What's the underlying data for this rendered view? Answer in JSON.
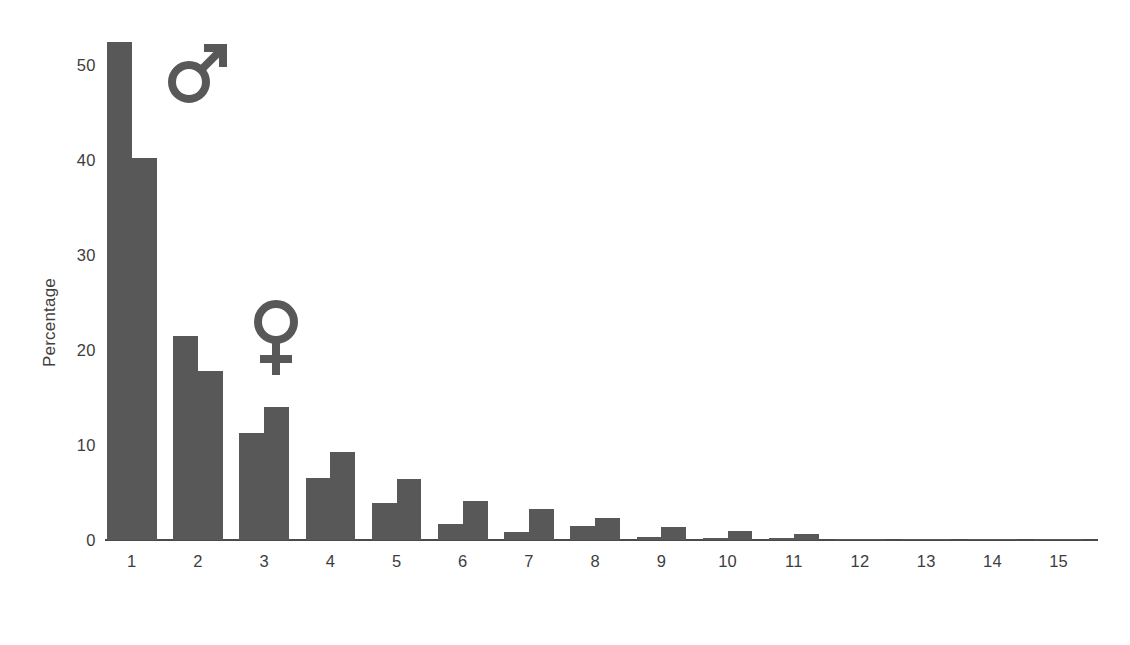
{
  "chart_data": {
    "type": "bar",
    "title": "",
    "xlabel": "Age of breeding birds",
    "ylabel": "Percentage",
    "categories": [
      "1",
      "2",
      "3",
      "4",
      "5",
      "6",
      "7",
      "8",
      "9",
      "10",
      "11",
      "12",
      "13",
      "14",
      "15"
    ],
    "ylim": [
      0,
      55
    ],
    "yticks": [
      0,
      10,
      20,
      30,
      40,
      50
    ],
    "ytick_labels": [
      "0",
      "10",
      "20",
      "30",
      "40",
      "50"
    ],
    "grid": false,
    "legend_position": "inside-plot-symbols",
    "series": [
      {
        "name": "Male",
        "symbol": "♂",
        "color": "#585858",
        "values": [
          52.5,
          21.5,
          11.3,
          6.5,
          3.9,
          1.7,
          0.8,
          1.5,
          0.3,
          0.2,
          0.25,
          0.1,
          0.1,
          0.1,
          0.1
        ]
      },
      {
        "name": "Female",
        "symbol": "♀",
        "color": "#585858",
        "values": [
          40.3,
          17.8,
          14.0,
          9.3,
          6.4,
          4.1,
          3.3,
          2.3,
          1.4,
          0.9,
          0.6,
          0.15,
          0.12,
          0.12,
          0.15
        ]
      }
    ],
    "annotations": [
      {
        "name": "male-symbol",
        "glyph": "♂",
        "label": "male-gender-symbol"
      },
      {
        "name": "female-symbol",
        "glyph": "♀",
        "label": "female-gender-symbol"
      }
    ]
  },
  "colors": {
    "bar": "#585858",
    "axis": "#4a4a4a",
    "text": "#3d3d3d",
    "background": "#ffffff"
  }
}
